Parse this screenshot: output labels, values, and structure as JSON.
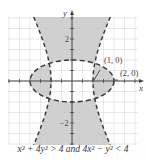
{
  "chart_data": {
    "type": "region",
    "title": "",
    "caption": "x² + 4y² > 4 and 4x² − y² < 4",
    "xlabel": "x",
    "ylabel": "y",
    "xlim": [
      -3,
      3
    ],
    "ylim": [
      -3,
      3
    ],
    "grid": true,
    "grid_step": 0.5,
    "y_tick_labels": [
      {
        "value": 2,
        "label": "2"
      },
      {
        "value": -2,
        "label": "−2"
      }
    ],
    "curves": [
      {
        "name": "ellipse",
        "equation": "x² + 4y² = 4",
        "style": "dashed",
        "semi_axes": {
          "a": 2,
          "b": 1
        }
      },
      {
        "name": "hyperbola",
        "equation": "4x² − y² = 4",
        "style": "dashed",
        "opens": "horizontal",
        "vertices": [
          [
            -1,
            0
          ],
          [
            1,
            0
          ]
        ]
      },
      {
        "name": "asymptotes",
        "equation": "y = ±2x",
        "style": "dashed"
      }
    ],
    "annotations": [
      {
        "text": "(1, 0)",
        "point": [
          1,
          0
        ]
      },
      {
        "text": "(2, 0)",
        "point": [
          2,
          0
        ]
      }
    ],
    "shaded_region": "outside ellipse and between hyperbola branches",
    "colors": {
      "shade": "#c8c8c8",
      "grid": "#d8d8d8",
      "curve": "#333333",
      "axis": "#444444"
    }
  }
}
